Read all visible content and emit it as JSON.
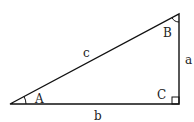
{
  "diagram": {
    "vertices": {
      "A": "A",
      "B": "B",
      "C": "C"
    },
    "sides": {
      "a": "a",
      "b": "b",
      "c": "c"
    },
    "right_angle_at": "C",
    "stroke_color": "#111111"
  }
}
